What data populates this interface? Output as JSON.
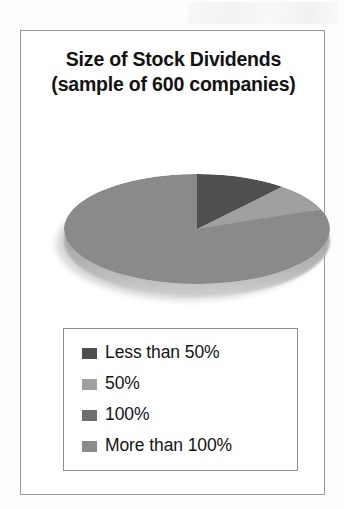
{
  "figure": {
    "title_line1": "Size of Stock Dividends",
    "title_line2": "(sample of 600 companies)",
    "frame_border_color": "#9a9a9a",
    "background_color": "#ffffff"
  },
  "chart_data": {
    "type": "pie",
    "title": "Size of Stock Dividends (sample of 600 companies)",
    "subtitle": "sample of 600 companies",
    "sample_size": 600,
    "categories": [
      "Less than 50%",
      "50%",
      "100%",
      "More than 100%"
    ],
    "values": [
      11,
      8,
      0,
      81
    ],
    "value_unit": "percent",
    "colors": [
      "#4f4f4f",
      "#a0a0a0",
      "#6f6f6f",
      "#8a8a8a"
    ],
    "legend_position": "bottom",
    "grid": false,
    "three_d": true,
    "slices": [
      {
        "label": "Less than 50%",
        "value": 11,
        "color": "#4f4f4f",
        "start_angle": 0,
        "end_angle": 40
      },
      {
        "label": "50%",
        "value": 8,
        "color": "#a0a0a0",
        "start_angle": 40,
        "end_angle": 69
      },
      {
        "label": "100%",
        "value": 0,
        "color": "#6f6f6f",
        "start_angle": 69,
        "end_angle": 69
      },
      {
        "label": "More than 100%",
        "value": 81,
        "color": "#8a8a8a",
        "start_angle": 69,
        "end_angle": 360
      }
    ]
  },
  "legend": {
    "items": [
      {
        "label": "Less than 50%",
        "color": "#4f4f4f"
      },
      {
        "label": "50%",
        "color": "#a0a0a0"
      },
      {
        "label": "100%",
        "color": "#6f6f6f"
      },
      {
        "label": "More than 100%",
        "color": "#8a8a8a"
      }
    ]
  }
}
